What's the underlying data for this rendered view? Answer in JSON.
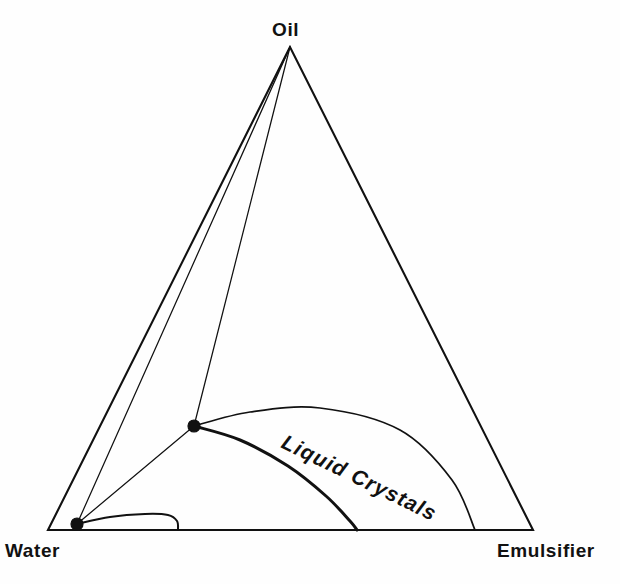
{
  "figure": {
    "kind": "ternary-phase-diagram",
    "background_color": "#fefefe",
    "line_color": "#111111"
  },
  "labels": {
    "top_vertex": "Oil",
    "left_vertex": "Water",
    "right_vertex": "Emulsifier",
    "region": "Liquid  Crystals"
  },
  "chart_data": {
    "type": "scatter",
    "title": "",
    "xlabel": "",
    "ylabel": "",
    "components": [
      "Water",
      "Oil",
      "Emulsifier"
    ],
    "vertices": {
      "Oil": [
        290,
        47
      ],
      "Water": [
        48,
        530
      ],
      "Emulsifier": [
        533,
        530
      ]
    },
    "nodes": [
      {
        "name": "lower-invariant-point",
        "x": 77,
        "y": 524
      },
      {
        "name": "upper-invariant-point",
        "x": 194,
        "y": 426
      }
    ],
    "tie_lines": [
      {
        "name": "oil-to-lower-node",
        "from": [
          290,
          47
        ],
        "to": [
          77,
          524
        ]
      },
      {
        "name": "oil-to-upper-node",
        "from": [
          290,
          47
        ],
        "to": [
          194,
          426
        ]
      },
      {
        "name": "upper-node-to-lower-node",
        "from": [
          194,
          426
        ],
        "to": [
          77,
          524
        ]
      }
    ],
    "boundaries": [
      {
        "name": "liquid-crystal-upper-arc",
        "weight": "thin",
        "points": [
          [
            194,
            426
          ],
          [
            250,
            412
          ],
          [
            320,
            408
          ],
          [
            400,
            430
          ],
          [
            452,
            480
          ],
          [
            475,
            530
          ]
        ]
      },
      {
        "name": "liquid-crystal-lower-arc",
        "weight": "thick",
        "points": [
          [
            194,
            426
          ],
          [
            240,
            440
          ],
          [
            288,
            466
          ],
          [
            326,
            496
          ],
          [
            350,
            521
          ],
          [
            357,
            530
          ]
        ]
      },
      {
        "name": "water-rich-micelle-dome",
        "weight": "small",
        "points": [
          [
            77,
            524
          ],
          [
            110,
            517
          ],
          [
            145,
            514
          ],
          [
            168,
            515
          ],
          [
            177,
            521
          ],
          [
            178,
            530
          ]
        ]
      }
    ],
    "axis_note": "grid off; no numeric ticks shown"
  },
  "geometry": {
    "region_label_position": {
      "x": 280,
      "y": 447
    },
    "region_label_rotation_deg": 26,
    "vertex_label_positions": {
      "Oil": {
        "x": 272,
        "y": 36
      },
      "Water": {
        "x": 5,
        "y": 557
      },
      "Emulsifier": {
        "x": 497,
        "y": 557
      }
    }
  }
}
